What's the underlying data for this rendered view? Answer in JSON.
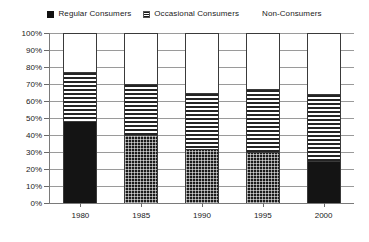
{
  "legend": {
    "position": "top-center",
    "entries": [
      {
        "label": "Regular Consumers",
        "marker": "solid-black-square",
        "swatch_class": "sw-solid"
      },
      {
        "label": "Occasional Consumers",
        "marker": "horizontal-lines-square",
        "swatch_class": "sw-stripes"
      },
      {
        "label": "Non-Consumers",
        "marker": "white-square",
        "swatch_class": "sw-empty"
      }
    ]
  },
  "chart_data": {
    "type": "bar",
    "stacked": true,
    "stack_total": 100,
    "title": "",
    "subtitle": "",
    "xlabel": "",
    "ylabel": "",
    "grid": true,
    "ylim": [
      0,
      100
    ],
    "ytick_labels": [
      "100%",
      "90%",
      "80%",
      "70%",
      "60%",
      "50%",
      "40%",
      "30%",
      "20%",
      "10%",
      "0%"
    ],
    "ytick_values": [
      100,
      90,
      80,
      70,
      60,
      50,
      40,
      30,
      20,
      10,
      0
    ],
    "categories": [
      "1980",
      "1985",
      "1990",
      "1995",
      "2000"
    ],
    "series": [
      {
        "name": "Regular Consumers",
        "values": [
          48,
          40,
          32,
          30,
          25
        ],
        "fill": [
          "solid",
          "dotted",
          "dotted",
          "dotted",
          "solid"
        ]
      },
      {
        "name": "Occasional Consumers",
        "values": [
          29,
          30,
          33,
          37,
          39
        ],
        "fill": [
          "stripes",
          "stripes",
          "stripes",
          "stripes",
          "stripes"
        ]
      },
      {
        "name": "Non-Consumers",
        "values": [
          23,
          30,
          35,
          33,
          36
        ],
        "fill": [
          "empty",
          "empty",
          "empty",
          "empty",
          "empty"
        ]
      }
    ],
    "colors": {
      "regular": "#141414",
      "occasional": "#242424",
      "non": "#ffffff",
      "gridline": "#9a9a9a",
      "axis": "#7a7a7a"
    }
  }
}
